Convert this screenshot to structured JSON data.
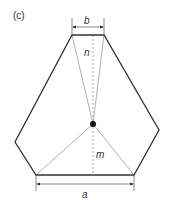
{
  "figure": {
    "panel_label": "(c)",
    "labels": {
      "top_width": "b",
      "bottom_width": "a",
      "upper_distance": "n",
      "lower_distance": "m"
    },
    "colors": {
      "outline": "#333333",
      "thin_line": "#9a9a9a",
      "dashed_axis": "#9a9a9a",
      "dimension": "#333333",
      "center_point": "#111111"
    }
  }
}
